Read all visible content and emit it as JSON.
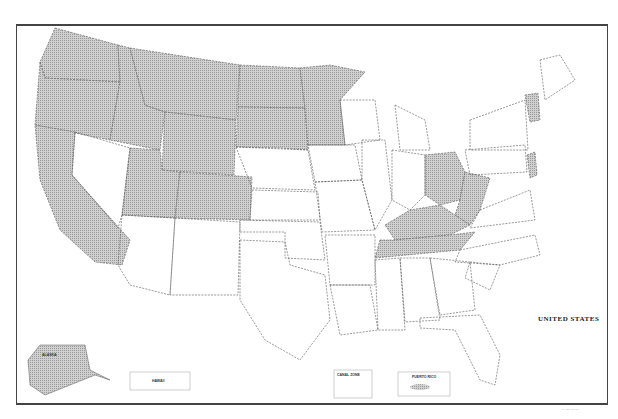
{
  "map": {
    "title": "UNITED STATES",
    "footer_code": "-- --- -- ---",
    "shade_color": "#bdbdbd",
    "border_color": "#444444",
    "shaded_states": [
      "Washington",
      "Oregon",
      "California",
      "Idaho",
      "Montana",
      "Wyoming",
      "Utah",
      "Colorado",
      "North Dakota",
      "South Dakota",
      "Minnesota",
      "Ohio",
      "West Virginia",
      "Kentucky",
      "Tennessee",
      "Vermont",
      "New Jersey",
      "Alaska"
    ],
    "insets": {
      "alaska": "ALASKA",
      "hawaii": "HAWAII",
      "canal_zone": "CANAL ZONE",
      "puerto_rico": "PUERTO RICO"
    }
  }
}
